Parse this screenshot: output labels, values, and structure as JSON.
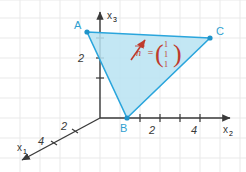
{
  "figure": {
    "background_color": "#ffffff",
    "grid": {
      "visible": true,
      "color": "#e9e9e9",
      "spacing_px": 20
    }
  },
  "axes": [
    {
      "id": "x1",
      "label": "x",
      "subscript": "1",
      "direction": "down-left",
      "arrow": true
    },
    {
      "id": "x2",
      "label": "x",
      "subscript": "2",
      "direction": "right",
      "arrow": true
    },
    {
      "id": "x3",
      "label": "x",
      "subscript": "3",
      "direction": "up",
      "arrow": true
    }
  ],
  "ticks": {
    "x1": [
      "2",
      "4"
    ],
    "x2": [
      "2",
      "4"
    ],
    "x3": [
      "2"
    ]
  },
  "points": [
    {
      "name": "A",
      "label": "A",
      "x": 87,
      "y": 32
    },
    {
      "name": "B",
      "label": "B",
      "x": 127,
      "y": 118
    },
    {
      "name": "C",
      "label": "C",
      "x": 210,
      "y": 38
    }
  ],
  "triangle": {
    "fill_color": "#b9e3f2",
    "stroke_color": "#2aa5dc",
    "vertices": [
      "A",
      "B",
      "C"
    ]
  },
  "normal_vector": {
    "color": "#bf3b2c",
    "symbol": "n",
    "equals": "=",
    "components": [
      "1",
      "1",
      "1"
    ],
    "paren_left": "(",
    "paren_right": ")"
  },
  "colors": {
    "fill": "#b9e3f2",
    "stroke": "#2aa5dc",
    "accent_red": "#bf3b2c",
    "grid": "#e9e9e9",
    "axis": "#3a3a3a"
  }
}
